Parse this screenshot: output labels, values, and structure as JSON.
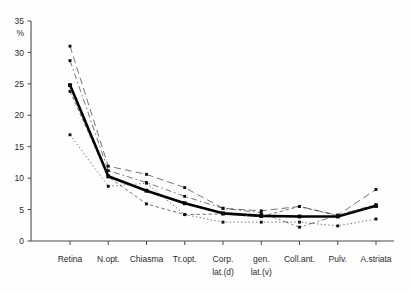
{
  "chart_data": {
    "type": "line",
    "title": "",
    "subtitle": "",
    "xlabel": "",
    "ylabel": "%",
    "ylim": [
      0,
      35
    ],
    "yticks": [
      0,
      5,
      10,
      15,
      20,
      25,
      30,
      35
    ],
    "grid": false,
    "legend": "none",
    "categories": [
      "Retina",
      "N.opt.",
      "Chiasma",
      "Tr.opt.",
      "Corp. gen. lat.(d)",
      "lat.(v)",
      "Coll.ant.",
      "Pulv.",
      "A.striata"
    ],
    "category_labels": [
      {
        "line1": "Retina",
        "line2": ""
      },
      {
        "line1": "N.opt.",
        "line2": ""
      },
      {
        "line1": "Chiasma",
        "line2": ""
      },
      {
        "line1": "Tr.opt.",
        "line2": ""
      },
      {
        "line1": "Corp.",
        "line2": "lat.(d)"
      },
      {
        "line1": "gen.",
        "line2": "lat.(v)"
      },
      {
        "line1": "Coll.ant.",
        "line2": ""
      },
      {
        "line1": "Pulv.",
        "line2": ""
      },
      {
        "line1": "A.striata",
        "line2": ""
      }
    ],
    "series": [
      {
        "name": "mean",
        "style": "solid-thick",
        "values": [
          24.8,
          10.3,
          8.0,
          6.0,
          4.4,
          4.0,
          3.9,
          3.9,
          5.6
        ]
      },
      {
        "name": "case-1",
        "style": "dashed-long",
        "values": [
          31.0,
          11.9,
          10.6,
          8.5,
          5.2,
          4.8,
          5.5,
          4.1,
          8.2
        ]
      },
      {
        "name": "case-2",
        "style": "dash-dot",
        "values": [
          28.7,
          11.2,
          9.3,
          7.1,
          5.2,
          4.5,
          2.2,
          4.1,
          5.8
        ]
      },
      {
        "name": "case-3",
        "style": "dashed-short",
        "values": [
          23.8,
          10.2,
          5.9,
          4.2,
          4.3,
          3.9,
          5.5,
          4.0,
          5.5
        ]
      },
      {
        "name": "case-4",
        "style": "dotted",
        "values": [
          16.9,
          8.7,
          9.2,
          4.2,
          3.0,
          3.0,
          3.0,
          2.4,
          3.5
        ]
      }
    ],
    "axis": {
      "y_unit_symbol": "%"
    }
  }
}
